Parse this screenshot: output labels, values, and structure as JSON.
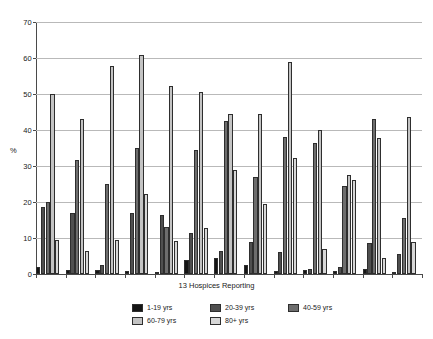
{
  "chart_data": {
    "type": "bar",
    "title": "",
    "xlabel": "13 Hospices Reporting",
    "ylabel": "%",
    "ylim": [
      0,
      70
    ],
    "yticks": [
      0,
      10,
      20,
      30,
      40,
      50,
      60,
      70
    ],
    "grid": true,
    "legend_position": "bottom",
    "categories": [
      "1",
      "2",
      "3",
      "4",
      "5",
      "6",
      "7",
      "8",
      "9",
      "10",
      "11",
      "12",
      "13"
    ],
    "series": [
      {
        "name": "1-19 yrs",
        "color": "#151515",
        "values": [
          2.0,
          1.0,
          1.0,
          0.8,
          0.5,
          4.0,
          4.5,
          2.5,
          0.8,
          1.0,
          0.8,
          1.5,
          0.5
        ]
      },
      {
        "name": "20-39 yrs",
        "color": "#4f4f4f",
        "values": [
          18.5,
          17.0,
          2.5,
          17.0,
          16.5,
          11.5,
          6.5,
          9.0,
          6.0,
          1.5,
          2.0,
          8.5,
          5.5
        ]
      },
      {
        "name": "40-59 yrs",
        "color": "#6d6d6d",
        "values": [
          20.0,
          31.8,
          25.0,
          35.0,
          13.0,
          34.5,
          42.5,
          27.0,
          38.0,
          36.5,
          24.5,
          43.0,
          15.5
        ]
      },
      {
        "name": "60-79 yrs",
        "color": "#c3c3c3",
        "values": [
          50.0,
          43.0,
          57.8,
          60.8,
          52.3,
          50.5,
          44.5,
          44.5,
          59.0,
          40.0,
          27.5,
          37.8,
          43.5
        ]
      },
      {
        "name": "80+ yrs",
        "color": "#d7d7d7",
        "values": [
          9.5,
          6.5,
          9.5,
          22.2,
          9.3,
          12.8,
          29.0,
          19.5,
          32.3,
          7.0,
          26.0,
          4.5,
          9.0
        ]
      }
    ]
  },
  "axis": {
    "y_label": "%",
    "x_label": "13 Hospices Reporting",
    "y_tick_labels": [
      "0",
      "10",
      "20",
      "30",
      "40",
      "50",
      "60",
      "70"
    ]
  },
  "legend": {
    "items": [
      {
        "label": "1-19 yrs",
        "color": "#151515"
      },
      {
        "label": "20-39 yrs",
        "color": "#4f4f4f"
      },
      {
        "label": "40-59 yrs",
        "color": "#6d6d6d"
      },
      {
        "label": "60-79 yrs",
        "color": "#c3c3c3"
      },
      {
        "label": "80+ yrs",
        "color": "#d7d7d7"
      }
    ]
  }
}
